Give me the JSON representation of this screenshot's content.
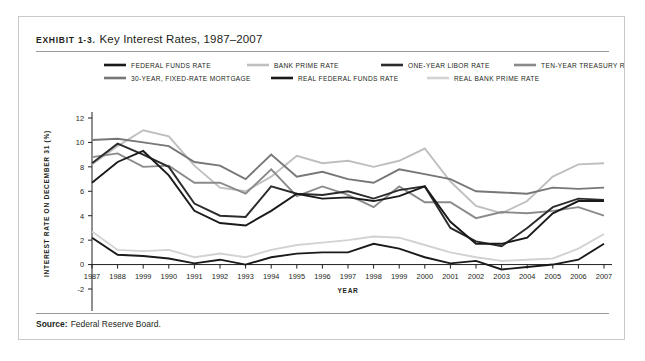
{
  "exhibit": {
    "tag": "Exhibit 1-3.",
    "title": "Key Interest Rates, 1987–2007",
    "source_label": "Source:",
    "source_text": "Federal Reserve Board."
  },
  "chart_data": {
    "type": "line",
    "title": "Key Interest Rates, 1987–2007",
    "xlabel": "YEAR",
    "ylabel": "INTEREST RATE ON DECEMBER 31 (%)",
    "xlim": [
      1987,
      2007
    ],
    "ylim": [
      -2,
      12
    ],
    "yticks": [
      -2,
      0,
      2,
      4,
      6,
      8,
      10,
      12
    ],
    "grid": false,
    "legend_position": "top",
    "categories": [
      "1987",
      "1988",
      "1999",
      "1990",
      "1991",
      "1992",
      "1993",
      "1994",
      "1995",
      "1996",
      "1997",
      "1998",
      "1999",
      "2000",
      "2001",
      "2002",
      "2003",
      "2004",
      "2005",
      "2006",
      "2007"
    ],
    "series": [
      {
        "name": "FEDERAL FUNDS RATE",
        "color": "#1a1a1a",
        "width": 1.9,
        "values": [
          6.7,
          8.4,
          9.3,
          7.3,
          4.4,
          3.4,
          3.2,
          4.4,
          5.8,
          5.4,
          5.5,
          5.2,
          5.6,
          6.4,
          3.5,
          1.7,
          1.7,
          2.2,
          4.2,
          5.2,
          5.2
        ]
      },
      {
        "name": "BANK PRIME RATE",
        "color": "#bfbfbf",
        "width": 1.9,
        "values": [
          8.2,
          9.7,
          11.0,
          10.5,
          8.1,
          6.3,
          6.0,
          7.2,
          8.9,
          8.3,
          8.5,
          8.0,
          8.5,
          9.5,
          6.8,
          4.8,
          4.2,
          5.2,
          7.2,
          8.2,
          8.3
        ]
      },
      {
        "name": "ONE-YEAR LIBOR RATE",
        "color": "#2b2b2b",
        "width": 1.9,
        "values": [
          8.3,
          9.9,
          9.0,
          8.0,
          5.0,
          4.0,
          3.9,
          6.4,
          5.8,
          5.7,
          6.0,
          5.4,
          6.1,
          6.4,
          3.0,
          1.9,
          1.5,
          3.0,
          4.7,
          5.4,
          5.3
        ]
      },
      {
        "name": "TEN-YEAR TREASURY RATE",
        "color": "#8a8a8a",
        "width": 1.9,
        "values": [
          8.8,
          9.1,
          8.0,
          8.1,
          6.7,
          6.7,
          5.8,
          7.8,
          5.6,
          6.4,
          5.7,
          4.7,
          6.4,
          5.1,
          5.1,
          3.8,
          4.3,
          4.2,
          4.4,
          4.7,
          4.0
        ]
      },
      {
        "name": "30-YEAR, FIXED-RATE MORTGAGE",
        "color": "#777777",
        "width": 1.9,
        "values": [
          10.2,
          10.3,
          10.0,
          9.7,
          8.4,
          8.1,
          7.0,
          9.0,
          7.2,
          7.6,
          7.0,
          6.7,
          7.8,
          7.4,
          7.0,
          6.0,
          5.9,
          5.8,
          6.3,
          6.2,
          6.3
        ]
      },
      {
        "name": "REAL FEDERAL FUNDS RATE",
        "color": "#1a1a1a",
        "width": 1.9,
        "values": [
          2.2,
          0.8,
          0.7,
          0.5,
          0.1,
          0.4,
          0.0,
          0.6,
          0.9,
          1.0,
          1.0,
          1.7,
          1.3,
          0.6,
          0.1,
          0.3,
          -0.4,
          -0.2,
          0.0,
          0.4,
          1.7
        ]
      },
      {
        "name": "REAL BANK PRIME RATE",
        "color": "#d2d2d2",
        "width": 1.9,
        "values": [
          2.7,
          1.2,
          1.1,
          1.2,
          0.6,
          0.9,
          0.6,
          1.2,
          1.6,
          1.8,
          2.0,
          2.3,
          2.2,
          1.6,
          1.0,
          0.6,
          0.3,
          0.4,
          0.5,
          1.3,
          2.5
        ]
      }
    ]
  }
}
